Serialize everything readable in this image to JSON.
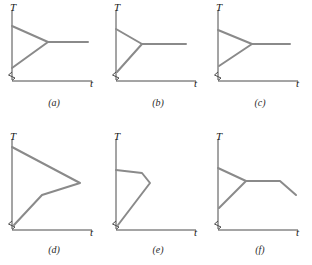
{
  "figure": {
    "colors": {
      "axis": "#4a4a4a",
      "curve": "#8a8a8a",
      "text": "#1a1a1a",
      "background": "#ffffff"
    },
    "axis_labels": {
      "vertical": "T",
      "horizontal": "t"
    },
    "panels": [
      {
        "id": "a",
        "caption": "(a)",
        "description": "Narrow wedge opening from the T axis to a vertex, then a flat horizontal plateau extending to the right",
        "curve_points": [
          [
            10,
            24
          ],
          [
            46,
            40
          ],
          [
            10,
            66
          ],
          [
            46,
            40
          ],
          [
            86,
            40
          ]
        ]
      },
      {
        "id": "b",
        "caption": "(b)",
        "description": "Short upper branch and long lower branch meeting at a vertex, then a flat horizontal plateau to the right",
        "curve_points": [
          [
            10,
            27
          ],
          [
            36,
            42
          ],
          [
            11,
            70
          ],
          [
            36,
            42
          ],
          [
            80,
            42
          ]
        ]
      },
      {
        "id": "c",
        "caption": "(c)",
        "description": "Compact closed triangle against the T axis with a horizontal plateau leaving its vertex",
        "curve_points": [
          [
            10,
            28
          ],
          [
            44,
            42
          ],
          [
            11,
            64
          ],
          [
            44,
            42
          ],
          [
            82,
            42
          ]
        ]
      },
      {
        "id": "d",
        "caption": "(d)",
        "description": "Large open wedge: long descending branch to a far-right tip, short return branch to a kink, then a branch down-left to the axis",
        "curve_points": [
          [
            10,
            14
          ],
          [
            78,
            50
          ],
          [
            40,
            62
          ],
          [
            12,
            92
          ]
        ]
      },
      {
        "id": "e",
        "caption": "(e)",
        "description": "Narrow elongated triangle: short near-horizontal top, short drop to a right vertex, then a long hypotenuse down-left to the origin",
        "curve_points": [
          [
            10,
            37
          ],
          [
            36,
            40
          ],
          [
            44,
            50
          ],
          [
            12,
            95
          ]
        ]
      },
      {
        "id": "f",
        "caption": "(f)",
        "description": "Wedge at the axis, a horizontal plateau, then a descending branch at the right end",
        "curve_points": [
          [
            10,
            35
          ],
          [
            38,
            48
          ],
          [
            11,
            75
          ],
          [
            38,
            48
          ],
          [
            72,
            48
          ],
          [
            88,
            62
          ]
        ]
      }
    ]
  }
}
